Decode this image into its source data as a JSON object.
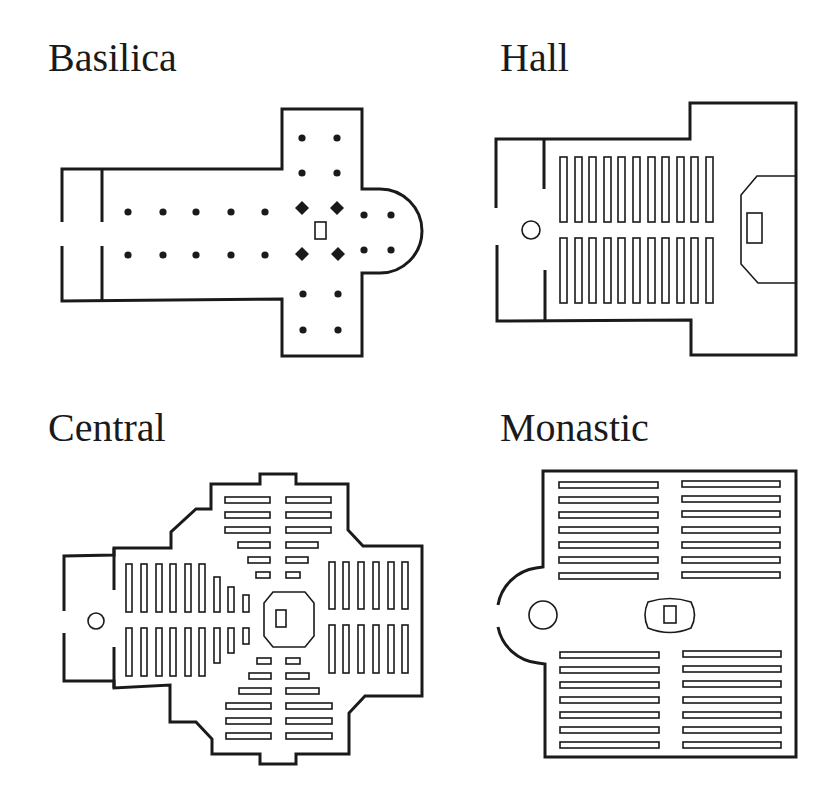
{
  "figure": {
    "panels": [
      {
        "id": "basilica",
        "label": "Basilica",
        "title_pos": [
          48,
          38
        ],
        "elements": {
          "columns_round": 22,
          "piers_diamond": 4,
          "altar": 1,
          "apse": "semicircular east",
          "narthex": true
        }
      },
      {
        "id": "hall",
        "label": "Hall",
        "title_pos": [
          500,
          38
        ],
        "elements": {
          "pews": 22,
          "pew_columns": 11,
          "pew_rows": 2,
          "font": 1,
          "chancel": "polygonal with altar"
        }
      },
      {
        "id": "central",
        "label": "Central",
        "title_pos": [
          48,
          408
        ],
        "elements": {
          "pews_per_arm": "graduated",
          "font": 1,
          "altar_enclosure": "octagonal",
          "plan": "cross with chamfered corners"
        }
      },
      {
        "id": "monastic",
        "label": "Monastic",
        "title_pos": [
          500,
          408
        ],
        "elements": {
          "pews": 28,
          "pew_blocks": 4,
          "pews_per_block": 7,
          "font": 1,
          "altar_enclosure": "barrel-shaped",
          "apse": "semicircular west entrance"
        }
      }
    ],
    "colors": {
      "ink": "#1a1a1a",
      "background": "#ffffff"
    }
  }
}
